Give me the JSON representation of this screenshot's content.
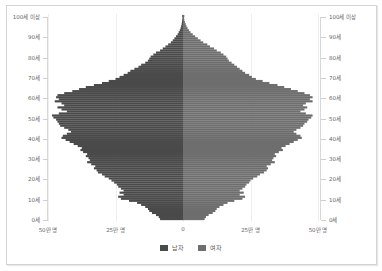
{
  "chart_data": {
    "type": "bar",
    "subtype": "population-pyramid",
    "title": "",
    "xlabel": "",
    "ylabel": "",
    "x_unit": "만 명",
    "xlim": [
      -50,
      50
    ],
    "x_ticks": [
      {
        "value": -50,
        "label": "50만 명"
      },
      {
        "value": -25,
        "label": "25만 명"
      },
      {
        "value": 0,
        "label": "0"
      },
      {
        "value": 25,
        "label": "25만 명"
      },
      {
        "value": 50,
        "label": "50만 명"
      }
    ],
    "y_ticks": [
      {
        "age": 0,
        "label": "0세"
      },
      {
        "age": 10,
        "label": "10세"
      },
      {
        "age": 20,
        "label": "20세"
      },
      {
        "age": 30,
        "label": "30세"
      },
      {
        "age": 40,
        "label": "40세"
      },
      {
        "age": 50,
        "label": "50세"
      },
      {
        "age": 60,
        "label": "60세"
      },
      {
        "age": 70,
        "label": "70세"
      },
      {
        "age": 80,
        "label": "80세"
      },
      {
        "age": 90,
        "label": "90세"
      },
      {
        "age": 100,
        "label": "100세 이상"
      }
    ],
    "categories_note": "ages 0 through 100 (100 = 100세 이상), values in 만 명 (10,000 people)",
    "grid": true,
    "legend_position": "bottom",
    "series": [
      {
        "name": "남자",
        "color": "#4a4a4a",
        "values": [
          8.5,
          9.0,
          10.0,
          11.5,
          12.5,
          13.0,
          14.0,
          15.5,
          17.0,
          20.0,
          23.0,
          24.0,
          22.0,
          23.5,
          22.0,
          23.0,
          24.0,
          24.5,
          25.5,
          26.5,
          27.5,
          29.0,
          30.0,
          31.5,
          32.0,
          33.0,
          32.5,
          34.0,
          35.5,
          34.5,
          35.0,
          36.0,
          35.5,
          37.0,
          38.0,
          37.5,
          39.0,
          40.5,
          42.0,
          43.5,
          45.0,
          44.5,
          43.0,
          41.5,
          42.5,
          44.0,
          45.5,
          46.0,
          46.5,
          47.0,
          48.0,
          48.5,
          46.0,
          43.0,
          45.0,
          46.5,
          44.0,
          45.0,
          47.5,
          46.0,
          47.0,
          46.5,
          44.0,
          41.0,
          38.5,
          36.0,
          33.0,
          30.0,
          27.5,
          25.0,
          23.5,
          22.0,
          20.5,
          19.5,
          18.0,
          16.5,
          15.5,
          14.0,
          13.0,
          12.5,
          12.0,
          11.0,
          10.0,
          8.5,
          7.5,
          6.5,
          5.5,
          4.5,
          3.8,
          3.2,
          2.6,
          2.0,
          1.6,
          1.2,
          0.9,
          0.7,
          0.5,
          0.4,
          0.3,
          0.2,
          0.3
        ]
      },
      {
        "name": "여자",
        "color": "#6e6e6e",
        "values": [
          8.0,
          8.5,
          9.5,
          11.0,
          12.0,
          12.5,
          13.5,
          15.0,
          16.5,
          19.0,
          22.0,
          23.0,
          21.0,
          22.5,
          21.0,
          22.0,
          23.0,
          23.5,
          24.5,
          25.0,
          26.0,
          27.5,
          28.5,
          30.0,
          31.0,
          31.5,
          31.0,
          32.5,
          34.0,
          33.0,
          33.5,
          34.5,
          34.0,
          35.5,
          37.0,
          36.5,
          38.0,
          39.5,
          41.0,
          42.5,
          44.0,
          43.5,
          42.0,
          41.0,
          42.0,
          43.5,
          44.5,
          45.0,
          46.0,
          46.5,
          47.5,
          48.0,
          45.5,
          43.5,
          45.0,
          46.0,
          44.5,
          45.5,
          48.0,
          47.0,
          48.0,
          47.0,
          45.0,
          42.5,
          40.0,
          37.5,
          35.0,
          32.0,
          29.5,
          27.0,
          25.5,
          24.5,
          23.0,
          22.0,
          21.0,
          20.0,
          19.0,
          18.0,
          17.0,
          16.5,
          16.0,
          15.0,
          14.0,
          12.5,
          11.5,
          10.0,
          9.0,
          7.5,
          6.5,
          5.5,
          4.5,
          3.6,
          2.8,
          2.2,
          1.7,
          1.3,
          1.0,
          0.7,
          0.5,
          0.4,
          0.5
        ]
      }
    ]
  },
  "legend": {
    "male_label": "남자",
    "female_label": "여자",
    "male_color": "#4a4a4a",
    "female_color": "#6e6e6e"
  },
  "axis": {
    "x_labels": [
      "50만 명",
      "25만 명",
      "0",
      "25만 명",
      "50만 명"
    ],
    "y_labels": [
      "100세 이상",
      "90세",
      "80세",
      "70세",
      "60세",
      "50세",
      "40세",
      "30세",
      "20세",
      "10세",
      "0세"
    ]
  }
}
